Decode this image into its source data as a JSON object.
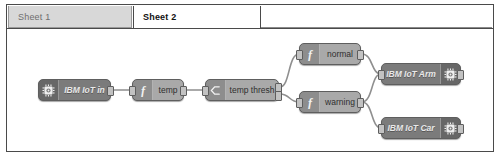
{
  "window": {
    "title": "Node-RED flow editor"
  },
  "tabs": [
    {
      "label": "Sheet 1",
      "active": false,
      "name": "tab-sheet-1"
    },
    {
      "label": "Sheet 2",
      "active": true,
      "name": "tab-sheet-2"
    }
  ],
  "colors": {
    "canvas_background": "#ffffff",
    "canvas_border": "#4a4a4a",
    "node_dark": "#7b7b7b",
    "node_light": "#a9a9a9",
    "node_border": "#5e5e5e",
    "port": "#c2c2c2",
    "wire": "#8f8f8f",
    "tab_inactive_bg": "#d8d8d8",
    "tab_inactive_text": "#6f6f6f",
    "tab_active_text": "#111111"
  },
  "flow": {
    "nodes": [
      {
        "id": "ibm-iot-in",
        "label": "IBM IoT in",
        "type": "input",
        "icon": "chip-icon",
        "icon_side": "left",
        "style": "dark",
        "x": 31,
        "y": 50,
        "w": 73,
        "ports_in": 0,
        "ports_out": 1
      },
      {
        "id": "temp",
        "label": "temp",
        "type": "function",
        "icon": "function-icon",
        "icon_side": "left",
        "style": "light",
        "x": 125,
        "y": 50,
        "w": 52,
        "ports_in": 1,
        "ports_out": 1
      },
      {
        "id": "temp-thresh",
        "label": "temp thresh",
        "type": "switch",
        "icon": "switch-icon",
        "icon_side": "left",
        "style": "light",
        "x": 198,
        "y": 50,
        "w": 74,
        "ports_in": 1,
        "ports_out": 2
      },
      {
        "id": "normal",
        "label": "normal",
        "type": "function",
        "icon": "function-icon",
        "icon_side": "left",
        "style": "light",
        "x": 292,
        "y": 14,
        "w": 62,
        "ports_in": 1,
        "ports_out": 1
      },
      {
        "id": "warning",
        "label": "warning",
        "type": "function",
        "icon": "function-icon",
        "icon_side": "left",
        "style": "light",
        "x": 292,
        "y": 62,
        "w": 62,
        "ports_in": 1,
        "ports_out": 1
      },
      {
        "id": "ibm-iot-arm",
        "label": "IBM IoT Arm",
        "type": "output",
        "icon": "chip-icon",
        "icon_side": "right",
        "style": "dark",
        "x": 374,
        "y": 34,
        "w": 80,
        "ports_in": 1,
        "ports_out": 1
      },
      {
        "id": "ibm-iot-car",
        "label": "IBM IoT Car",
        "type": "output",
        "icon": "chip-icon",
        "icon_side": "right",
        "style": "dark",
        "x": 374,
        "y": 88,
        "w": 80,
        "ports_in": 1,
        "ports_out": 1
      }
    ],
    "wires": [
      {
        "from": "ibm-iot-in",
        "to": "temp"
      },
      {
        "from": "temp",
        "to": "temp-thresh"
      },
      {
        "from": "temp-thresh",
        "to": "normal"
      },
      {
        "from": "temp-thresh",
        "to": "warning"
      },
      {
        "from": "normal",
        "to": "ibm-iot-arm"
      },
      {
        "from": "warning",
        "to": "ibm-iot-arm"
      },
      {
        "from": "warning",
        "to": "ibm-iot-car"
      }
    ]
  }
}
